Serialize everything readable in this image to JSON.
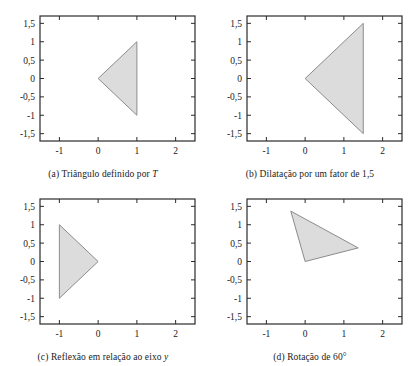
{
  "figure": {
    "background_color": "#ffffff",
    "panel_count": 4
  },
  "axes_common": {
    "x_ticks": [
      "-1",
      "0",
      "1",
      "2"
    ],
    "x_tick_values": [
      -1,
      0,
      1,
      2
    ],
    "y_ticks": [
      "1,5",
      "1",
      "0,5",
      "0",
      "-0,5",
      "-1",
      "-1,5"
    ],
    "y_tick_values": [
      1.5,
      1,
      0.5,
      0,
      -0.5,
      -1,
      -1.5
    ],
    "xlim": [
      -1.5,
      2.5
    ],
    "ylim": [
      -1.7,
      1.7
    ],
    "grid": false,
    "axis_color": "#2b2b2b",
    "shape_fill": "#dcdcdc",
    "shape_stroke": "#8c8c8c"
  },
  "panels": {
    "a": {
      "caption_prefix": "(a) ",
      "caption_text": "Triângulo definido por ",
      "caption_italic": "T",
      "caption_full": "(a) Triângulo definido por T"
    },
    "b": {
      "caption_prefix": "(b) ",
      "caption_text": "Dilatação por um fator de 1,5",
      "caption_italic": "",
      "caption_full": "(b) Dilatação por um fator de 1,5"
    },
    "c": {
      "caption_prefix": "(c) ",
      "caption_text": "Reflexão em relação ao eixo ",
      "caption_italic": "y",
      "caption_full": "(c) Reflexão em relação ao eixo y"
    },
    "d": {
      "caption_prefix": "(d) ",
      "caption_text": "Rotação de 60°",
      "caption_italic": "",
      "caption_full": "(d) Rotação de 60°"
    }
  },
  "chart_data": [
    {
      "type": "polygon",
      "panel": "a",
      "title": "(a) Triângulo definido por T",
      "xlabel": "",
      "ylabel": "",
      "xlim": [
        -1.5,
        2.5
      ],
      "ylim": [
        -1.7,
        1.7
      ],
      "xticks": [
        -1,
        0,
        1,
        2
      ],
      "yticks": [
        1.5,
        1,
        0.5,
        0,
        -0.5,
        -1,
        -1.5
      ],
      "grid": false,
      "series": [
        {
          "name": "triangle T",
          "vertices": [
            [
              0,
              0
            ],
            [
              1,
              1
            ],
            [
              1,
              -1
            ]
          ],
          "fill": "#dcdcdc",
          "stroke": "#8c8c8c"
        }
      ]
    },
    {
      "type": "polygon",
      "panel": "b",
      "title": "(b) Dilatação por um fator de 1,5",
      "xlabel": "",
      "ylabel": "",
      "xlim": [
        -1.5,
        2.5
      ],
      "ylim": [
        -1.7,
        1.7
      ],
      "xticks": [
        -1,
        0,
        1,
        2
      ],
      "yticks": [
        1.5,
        1,
        0.5,
        0,
        -0.5,
        -1,
        -1.5
      ],
      "grid": false,
      "series": [
        {
          "name": "triangle scaled 1,5",
          "vertices": [
            [
              0,
              0
            ],
            [
              1.5,
              1.5
            ],
            [
              1.5,
              -1.5
            ]
          ],
          "fill": "#dcdcdc",
          "stroke": "#8c8c8c"
        }
      ]
    },
    {
      "type": "polygon",
      "panel": "c",
      "title": "(c) Reflexão em relação ao eixo y",
      "xlabel": "",
      "ylabel": "",
      "xlim": [
        -1.5,
        2.5
      ],
      "ylim": [
        -1.7,
        1.7
      ],
      "xticks": [
        -1,
        0,
        1,
        2
      ],
      "yticks": [
        1.5,
        1,
        0.5,
        0,
        -0.5,
        -1,
        -1.5
      ],
      "grid": false,
      "series": [
        {
          "name": "triangle reflected over y axis",
          "vertices": [
            [
              0,
              0
            ],
            [
              -1,
              1
            ],
            [
              -1,
              -1
            ]
          ],
          "fill": "#dcdcdc",
          "stroke": "#8c8c8c"
        }
      ]
    },
    {
      "type": "polygon",
      "panel": "d",
      "title": "(d) Rotação de 60°",
      "xlabel": "",
      "ylabel": "",
      "xlim": [
        -1.5,
        2.5
      ],
      "ylim": [
        -1.7,
        1.7
      ],
      "xticks": [
        -1,
        0,
        1,
        2
      ],
      "yticks": [
        1.5,
        1,
        0.5,
        0,
        -0.5,
        -1,
        -1.5
      ],
      "grid": false,
      "series": [
        {
          "name": "triangle rotated 60 degrees",
          "vertices": [
            [
              0,
              0
            ],
            [
              -0.37,
              1.37
            ],
            [
              1.37,
              0.37
            ]
          ],
          "fill": "#dcdcdc",
          "stroke": "#8c8c8c"
        }
      ]
    }
  ]
}
